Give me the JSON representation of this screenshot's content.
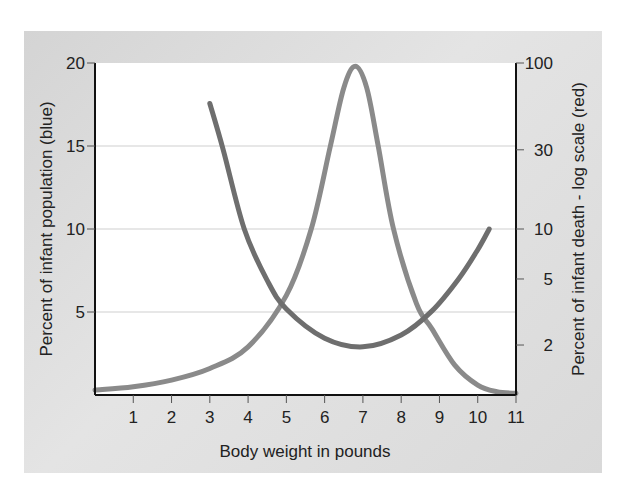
{
  "chart_data": {
    "type": "line",
    "title": "",
    "xlabel": "Body weight in pounds",
    "ylabel": "Percent of infant population (blue)",
    "y2label": "Percent of infant death - log scale (red)",
    "xlim": [
      0,
      11
    ],
    "ylim": [
      0,
      20
    ],
    "y2lim": [
      1,
      100
    ],
    "y2scale": "log",
    "x_ticks": [
      "1",
      "2",
      "3",
      "4",
      "5",
      "6",
      "7",
      "8",
      "9",
      "10",
      "11"
    ],
    "y_ticks": [
      "5",
      "10",
      "15",
      "20"
    ],
    "y2_ticks": [
      "2",
      "5",
      "10",
      "30",
      "100"
    ],
    "grid": "horizontal at y=5,10,15",
    "legend": "none (colors described in axis labels)",
    "series": [
      {
        "name": "Percent of infant population",
        "color_label": "blue",
        "axis": "left",
        "color": "#8a8a8a",
        "x": [
          0,
          1,
          2,
          3,
          4,
          5,
          5.65,
          6.15,
          6.5,
          6.8,
          7.1,
          7.4,
          7.8,
          8.4,
          8.8,
          9.4,
          10,
          10.5,
          11
        ],
        "y": [
          0.3,
          0.5,
          0.9,
          1.6,
          2.9,
          6.0,
          10,
          15,
          18.5,
          19.8,
          18.5,
          15,
          10,
          5.5,
          4.0,
          1.8,
          0.6,
          0.2,
          0.1
        ]
      },
      {
        "name": "Percent of infant death",
        "color_label": "red",
        "axis": "right (log)",
        "color": "#6e6e6e",
        "x": [
          3,
          3.35,
          3.9,
          4.5,
          5,
          6,
          7,
          8,
          8.8,
          9.5,
          10,
          10.3
        ],
        "y": [
          57,
          30,
          10,
          4.9,
          3.3,
          2.2,
          1.95,
          2.3,
          3.2,
          5,
          7.5,
          10
        ]
      }
    ]
  }
}
